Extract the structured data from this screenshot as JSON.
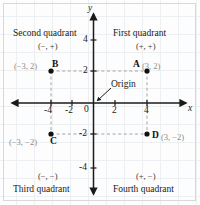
{
  "figure": {
    "type": "cartesian-coordinate-plane",
    "origin_label": "Origin",
    "axes": {
      "x_name": "x",
      "y_name": "y",
      "x_ticks": [
        "-4",
        "-2",
        "4"
      ],
      "y_ticks": [
        "4",
        "2",
        "-2",
        "-4"
      ],
      "zero_label": "0",
      "x_range": [
        -5.2,
        5.2
      ],
      "y_range": [
        -5.2,
        5.2
      ]
    },
    "quadrants": [
      {
        "id": "first",
        "name": "First quadrant",
        "signs": "(+, +)"
      },
      {
        "id": "second",
        "name": "Second quadrant",
        "signs": "(−, +)"
      },
      {
        "id": "third",
        "name": "Third quadrant",
        "signs": "(−, −)"
      },
      {
        "id": "fourth",
        "name": "Fourth quadrant",
        "signs": "(+, −)"
      }
    ],
    "points": [
      {
        "id": "A",
        "letter": "A",
        "coord_text": "(3, 2)",
        "x": 3,
        "y": 2
      },
      {
        "id": "B",
        "letter": "B",
        "coord_text": "(−3, 2)",
        "x": -3,
        "y": 2
      },
      {
        "id": "C",
        "letter": "C",
        "coord_text": "(−3, −2)",
        "x": -3,
        "y": -2
      },
      {
        "id": "D",
        "letter": "D",
        "coord_text": "(3, −2)",
        "x": 3,
        "y": -2
      }
    ],
    "colors": {
      "axis": "#1a1a1a",
      "point": "#111111",
      "dashed_guide": "#9a9a9a",
      "grid": "#eceff1",
      "coord_text": "#8a8a8a",
      "frame": "#d8d8d8"
    }
  }
}
